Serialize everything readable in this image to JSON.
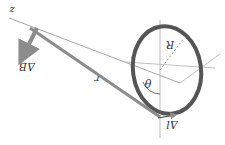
{
  "figure": {
    "labels": {
      "z": "z",
      "delta_b": "ΔB",
      "r": "r",
      "radius": "R",
      "theta": "θ",
      "delta_l": "Δl"
    },
    "colors": {
      "ring": "#555555",
      "arrow": "#8c8c8c",
      "axis": "#9a9a9a",
      "text": "#333333",
      "background": "#ffffff"
    }
  }
}
